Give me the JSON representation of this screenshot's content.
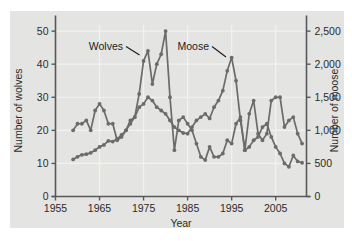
{
  "chart_data": {
    "type": "line",
    "title": "",
    "xlabel": "Year",
    "ylabel": "Number of wolves",
    "y2label": "Number of moose",
    "xlim": [
      1955,
      2012
    ],
    "ylim": [
      0,
      52
    ],
    "y2lim": [
      0,
      2600
    ],
    "grid": true,
    "legend_position": "inline-annotations",
    "xticks": [
      "1955",
      "1965",
      "1975",
      "1985",
      "1995",
      "2005"
    ],
    "xtick_values": [
      1955,
      1965,
      1975,
      1985,
      1995,
      2005
    ],
    "yticks": [
      "0",
      "10",
      "20",
      "30",
      "40",
      "50"
    ],
    "ytick_values": [
      0,
      10,
      20,
      30,
      40,
      50
    ],
    "y2ticks": [
      "0",
      "500",
      "1,000",
      "1,500",
      "2,000",
      "2,500"
    ],
    "y2tick_values": [
      0,
      500,
      1000,
      1500,
      2000,
      2500
    ],
    "annotations": [
      {
        "text": "Wolves",
        "x": 1971,
        "y": 44
      },
      {
        "text": "Moose",
        "x": 1987,
        "y": 44
      }
    ],
    "series": [
      {
        "name": "Wolves",
        "axis": "left",
        "color": "#6b6b6b",
        "x": [
          1959,
          1960,
          1961,
          1962,
          1963,
          1964,
          1965,
          1966,
          1967,
          1968,
          1969,
          1970,
          1971,
          1972,
          1973,
          1974,
          1975,
          1976,
          1977,
          1978,
          1979,
          1980,
          1981,
          1982,
          1983,
          1984,
          1985,
          1986,
          1987,
          1988,
          1989,
          1990,
          1991,
          1992,
          1993,
          1994,
          1995,
          1996,
          1997,
          1998,
          1999,
          2000,
          2001,
          2002,
          2003,
          2004,
          2005,
          2006,
          2007,
          2008,
          2009,
          2010,
          2011
        ],
        "values": [
          20,
          22,
          22,
          23,
          20,
          26,
          28,
          26,
          22,
          22,
          17,
          18,
          20,
          23,
          24,
          31,
          41,
          44,
          34,
          40,
          43,
          50,
          30,
          14,
          23,
          24,
          22,
          20,
          16,
          12,
          11,
          15,
          12,
          12,
          13,
          17,
          16,
          22,
          24,
          14,
          25,
          29,
          19,
          17,
          19,
          29,
          30,
          30,
          21,
          23,
          24,
          19,
          16
        ],
        "marker": "circle"
      },
      {
        "name": "Moose",
        "axis": "right",
        "color": "#6b6b6b",
        "x": [
          1959,
          1960,
          1961,
          1962,
          1963,
          1964,
          1965,
          1966,
          1967,
          1968,
          1969,
          1970,
          1971,
          1972,
          1973,
          1974,
          1975,
          1976,
          1977,
          1978,
          1979,
          1980,
          1981,
          1982,
          1983,
          1984,
          1985,
          1986,
          1987,
          1988,
          1989,
          1990,
          1991,
          1992,
          1993,
          1994,
          1995,
          1996,
          1997,
          1998,
          1999,
          2000,
          2001,
          2002,
          2003,
          2004,
          2005,
          2006,
          2007,
          2008,
          2009,
          2010,
          2011
        ],
        "values": [
          560,
          600,
          630,
          640,
          660,
          700,
          750,
          780,
          840,
          830,
          870,
          930,
          1000,
          1100,
          1200,
          1350,
          1400,
          1500,
          1450,
          1350,
          1300,
          1250,
          1150,
          1050,
          1000,
          960,
          950,
          1050,
          1150,
          1200,
          1250,
          1180,
          1350,
          1450,
          1600,
          1900,
          2100,
          1750,
          1150,
          700,
          750,
          850,
          900,
          1050,
          1100,
          900,
          750,
          650,
          500,
          450,
          620,
          530,
          510
        ],
        "marker": "circle"
      }
    ]
  }
}
